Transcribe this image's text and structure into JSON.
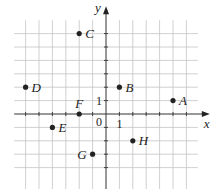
{
  "diagram": {
    "type": "coordinate-grid",
    "axes": {
      "x_label": "x",
      "y_label": "y",
      "origin_label": "0",
      "x_unit_label": "1",
      "y_unit_label": "1"
    },
    "grid": {
      "x_min": -7,
      "x_max": 7,
      "y_min": -5,
      "y_max": 7,
      "spacing_px": 13.4,
      "origin_px": [
        106,
        114
      ]
    },
    "points": [
      {
        "label": "A",
        "x": 5,
        "y": 1,
        "label_side": "right"
      },
      {
        "label": "B",
        "x": 1,
        "y": 2,
        "label_side": "right"
      },
      {
        "label": "C",
        "x": -2,
        "y": 6,
        "label_side": "right"
      },
      {
        "label": "D",
        "x": -6,
        "y": 2,
        "label_side": "right"
      },
      {
        "label": "E",
        "x": -4,
        "y": -1,
        "label_side": "right"
      },
      {
        "label": "F",
        "x": -2,
        "y": 0,
        "label_side": "above"
      },
      {
        "label": "G",
        "x": -1,
        "y": -3,
        "label_side": "left"
      },
      {
        "label": "H",
        "x": 2,
        "y": -2,
        "label_side": "right"
      }
    ],
    "colors": {
      "grid": "#c4c4c4",
      "axis": "#333333",
      "point": "#222222"
    }
  }
}
